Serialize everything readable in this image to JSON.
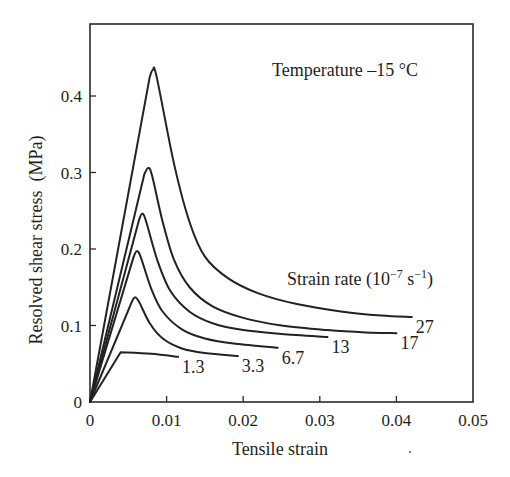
{
  "chart_data": {
    "type": "line",
    "title": "",
    "xlabel": "Tensile strain",
    "ylabel": "Resolved shear stress  (MPa)",
    "xlim": [
      0,
      0.05
    ],
    "ylim": [
      0,
      0.48
    ],
    "x_ticks": [
      0,
      0.01,
      0.02,
      0.03,
      0.04,
      0.05
    ],
    "x_tick_labels": [
      "0",
      "0.01",
      "0.02",
      "0.03",
      "0.04",
      "0.05"
    ],
    "y_ticks": [
      0,
      0.1,
      0.2,
      0.3,
      0.4
    ],
    "y_tick_labels": [
      "0",
      "0.1",
      "0.2",
      "0.3",
      "0.4"
    ],
    "grid": false,
    "annotations": {
      "temperature": "Temperature –15 °C",
      "legend_title": "Strain rate  (10",
      "legend_title_exp": "−7",
      "legend_title_unit": " s",
      "legend_title_unit_exp": "−1",
      "legend_title_close": ")"
    },
    "legend_position": "inline curve-end labels",
    "series": [
      {
        "name": "27",
        "label": "27",
        "points": [
          [
            0,
            0
          ],
          [
            0.0078,
            0.425
          ],
          [
            0.0082,
            0.434
          ],
          [
            0.0087,
            0.425
          ],
          [
            0.011,
            0.31
          ],
          [
            0.013,
            0.235
          ],
          [
            0.015,
            0.19
          ],
          [
            0.018,
            0.162
          ],
          [
            0.022,
            0.142
          ],
          [
            0.027,
            0.128
          ],
          [
            0.033,
            0.118
          ],
          [
            0.038,
            0.113
          ],
          [
            0.042,
            0.111
          ]
        ]
      },
      {
        "name": "17",
        "label": "17",
        "points": [
          [
            0,
            0
          ],
          [
            0.0071,
            0.298
          ],
          [
            0.0076,
            0.306
          ],
          [
            0.0081,
            0.296
          ],
          [
            0.0095,
            0.235
          ],
          [
            0.011,
            0.185
          ],
          [
            0.013,
            0.15
          ],
          [
            0.016,
            0.125
          ],
          [
            0.02,
            0.11
          ],
          [
            0.025,
            0.1
          ],
          [
            0.031,
            0.094
          ],
          [
            0.036,
            0.091
          ],
          [
            0.04,
            0.09
          ]
        ]
      },
      {
        "name": "13",
        "label": "13",
        "points": [
          [
            0,
            0
          ],
          [
            0.0064,
            0.238
          ],
          [
            0.0068,
            0.246
          ],
          [
            0.0073,
            0.237
          ],
          [
            0.0088,
            0.185
          ],
          [
            0.0105,
            0.145
          ],
          [
            0.013,
            0.118
          ],
          [
            0.016,
            0.103
          ],
          [
            0.02,
            0.094
          ],
          [
            0.025,
            0.089
          ],
          [
            0.031,
            0.085
          ]
        ]
      },
      {
        "name": "6.7",
        "label": "6.7",
        "points": [
          [
            0,
            0
          ],
          [
            0.0057,
            0.19
          ],
          [
            0.0061,
            0.197
          ],
          [
            0.0066,
            0.19
          ],
          [
            0.008,
            0.148
          ],
          [
            0.0095,
            0.118
          ],
          [
            0.012,
            0.095
          ],
          [
            0.015,
            0.083
          ],
          [
            0.019,
            0.076
          ],
          [
            0.0245,
            0.071
          ]
        ]
      },
      {
        "name": "3.3",
        "label": "3.3",
        "points": [
          [
            0,
            0
          ],
          [
            0.0055,
            0.132
          ],
          [
            0.0059,
            0.137
          ],
          [
            0.0064,
            0.131
          ],
          [
            0.0078,
            0.103
          ],
          [
            0.0095,
            0.083
          ],
          [
            0.012,
            0.07
          ],
          [
            0.015,
            0.064
          ],
          [
            0.0193,
            0.06
          ]
        ]
      },
      {
        "name": "1.3",
        "label": "1.3",
        "points": [
          [
            0,
            0
          ],
          [
            0.004,
            0.065
          ],
          [
            0.008,
            0.063
          ],
          [
            0.0115,
            0.059
          ]
        ]
      }
    ],
    "legend_entries": [
      "27",
      "17",
      "13",
      "6.7",
      "3.3",
      "1.3"
    ],
    "units": {
      "x": "",
      "y": "MPa",
      "strain_rate": "10^-7 s^-1"
    }
  }
}
